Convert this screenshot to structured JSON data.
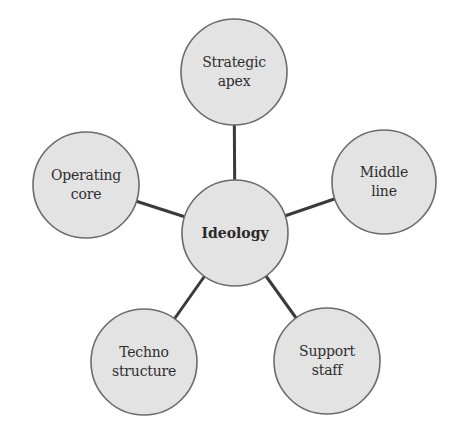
{
  "diagram": {
    "type": "hub-and-spoke",
    "colors": {
      "node_fill": "#e3e3e3",
      "node_stroke": "#6b6b6b",
      "edge": "#3a3a3a",
      "text": "#2e2e2e"
    },
    "center": {
      "id": "ideology",
      "label": "Ideology",
      "cx": 235,
      "cy": 233,
      "r": 53
    },
    "nodes": [
      {
        "id": "strategic-apex",
        "label": "Strategic\napex",
        "cx": 234,
        "cy": 72,
        "r": 53
      },
      {
        "id": "middle-line",
        "label": "Middle\nline",
        "cx": 384,
        "cy": 182,
        "r": 52
      },
      {
        "id": "support-staff",
        "label": "Support\nstaff",
        "cx": 327,
        "cy": 361,
        "r": 53
      },
      {
        "id": "techno-structure",
        "label": "Techno\nstructure",
        "cx": 144,
        "cy": 362,
        "r": 53
      },
      {
        "id": "operating-core",
        "label": "Operating\ncore",
        "cx": 86,
        "cy": 185,
        "r": 53
      }
    ],
    "edges": [
      {
        "from": "ideology",
        "to": "strategic-apex"
      },
      {
        "from": "ideology",
        "to": "middle-line"
      },
      {
        "from": "ideology",
        "to": "support-staff"
      },
      {
        "from": "ideology",
        "to": "techno-structure"
      },
      {
        "from": "ideology",
        "to": "operating-core"
      }
    ]
  }
}
